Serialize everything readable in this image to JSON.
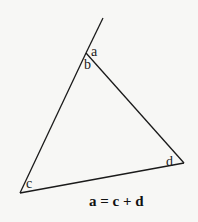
{
  "diagram": {
    "colors": {
      "background": "#f7f7f5",
      "line": "#1a1a1a",
      "text": "#111111"
    },
    "vertices": {
      "top": {
        "x": 86,
        "y": 53
      },
      "bottom_left": {
        "x": 20,
        "y": 193
      },
      "right": {
        "x": 184,
        "y": 163
      }
    },
    "extension_end": {
      "x": 103,
      "y": 18
    },
    "angle_labels": {
      "a": "a",
      "b": "b",
      "c": "c",
      "d": "d"
    },
    "equation": "a = c + d"
  }
}
